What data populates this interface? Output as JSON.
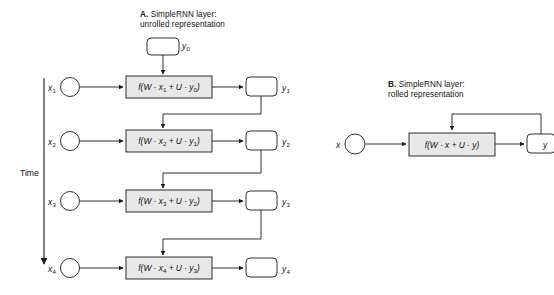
{
  "figure": {
    "background_color": "#ffffff",
    "line_color": "#1a1a1a",
    "box_fill_color": "#e8e8e8",
    "state_box_fill_color": "#ffffff"
  },
  "panels": [
    {
      "id": "A",
      "title_prefix": "A.",
      "title_line1": "SimpleRNN layer:",
      "title_line2": "unrolled representation",
      "time_axis_label": "Time",
      "initial_state": {
        "label": "y",
        "sub": "0"
      },
      "timesteps": [
        {
          "input_label": "x",
          "input_sub": "1",
          "formula": "f(W · x₁ + U · y₀)",
          "formula_parts": {
            "fn": "f(W · x",
            "x_sub": "1",
            "mid": " + U · y",
            "y_sub": "0",
            "close": ")"
          },
          "output_label": "y",
          "output_sub": "1"
        },
        {
          "input_label": "x",
          "input_sub": "2",
          "formula": "f(W · x₂ + U · y₁)",
          "formula_parts": {
            "fn": "f(W · x",
            "x_sub": "2",
            "mid": " + U · y",
            "y_sub": "1",
            "close": ")"
          },
          "output_label": "y",
          "output_sub": "2"
        },
        {
          "input_label": "x",
          "input_sub": "3",
          "formula": "f(W · x₃ + U · y₂)",
          "formula_parts": {
            "fn": "f(W · x",
            "x_sub": "3",
            "mid": " + U · y",
            "y_sub": "2",
            "close": ")"
          },
          "output_label": "y",
          "output_sub": "3"
        },
        {
          "input_label": "x",
          "input_sub": "4",
          "formula": "f(W · x₄ + U · y₃)",
          "formula_parts": {
            "fn": "f(W · x",
            "x_sub": "4",
            "mid": " + U · y",
            "y_sub": "3",
            "close": ")"
          },
          "output_label": "y",
          "output_sub": "4"
        }
      ]
    },
    {
      "id": "B",
      "title_prefix": "B.",
      "title_line1": "SimpleRNN layer:",
      "title_line2": "rolled representation",
      "input_label": "x",
      "formula": "f(W · x + U · y)",
      "formula_parts": {
        "fn": "f(W · x",
        "mid": " + U · y",
        "close": ")"
      },
      "output_label": "y"
    }
  ]
}
